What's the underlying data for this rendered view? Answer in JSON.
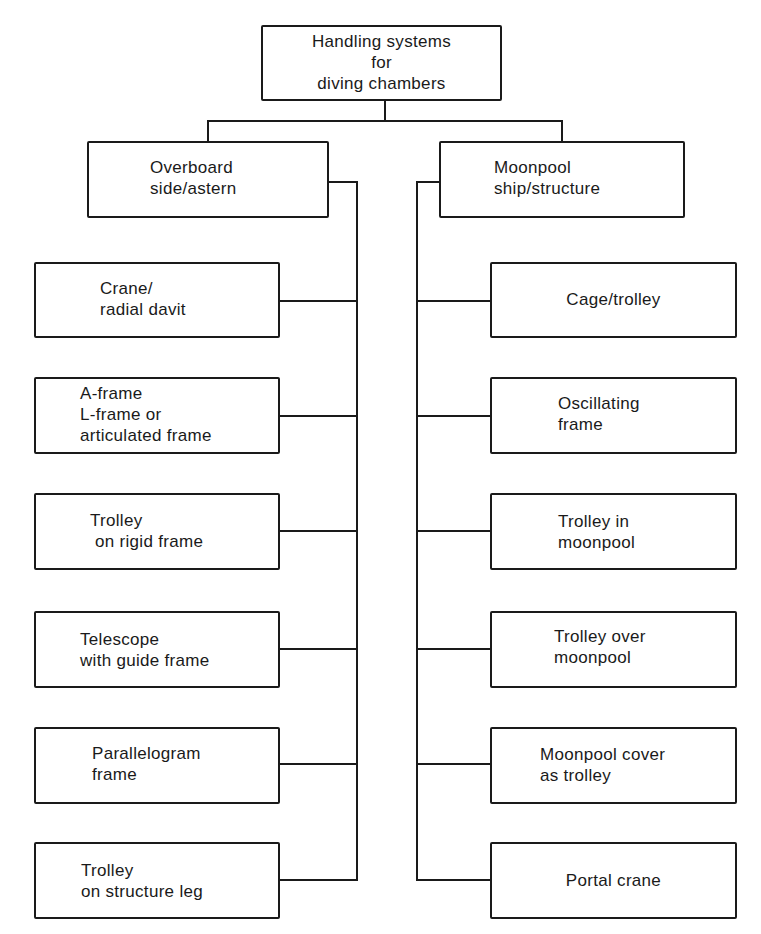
{
  "root": {
    "label": "Handling systems\nfor\ndiving chambers"
  },
  "branches": [
    {
      "label": "Overboard\nside/astern",
      "children": [
        "Crane/\nradial davit",
        "A-frame\nL-frame or\narticulated frame",
        "Trolley\n on rigid frame",
        "Telescope\nwith guide frame",
        "Parallelogram\nframe",
        "Trolley\non structure leg"
      ]
    },
    {
      "label": "Moonpool\nship/structure",
      "children": [
        "Cage/trolley",
        "Oscillating\nframe",
        "Trolley in\nmoonpool",
        "Trolley over\nmoonpool",
        "Moonpool cover\nas trolley",
        "Portal crane"
      ]
    }
  ],
  "colors": {
    "line": "#1a1a1a",
    "background": "#ffffff"
  }
}
